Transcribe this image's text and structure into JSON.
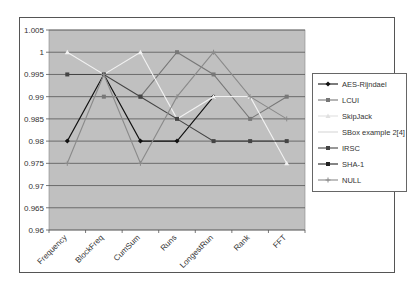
{
  "chart_data": {
    "type": "line",
    "title": "",
    "xlabel": "",
    "ylabel": "",
    "ylim": [
      0.96,
      1.005
    ],
    "yticks": [
      "1.005",
      "1",
      "0.995",
      "0.99",
      "0.985",
      "0.98",
      "0.975",
      "0.97",
      "0.965",
      "0.96"
    ],
    "grid": true,
    "legend_position": "right",
    "categories": [
      "Frequency",
      "BlockFreq",
      "CumSum",
      "Runs",
      "LongestRun",
      "Rank",
      "FFT"
    ],
    "series": [
      {
        "name": "AES-Rijndael",
        "color": "#111111",
        "marker": "diamond",
        "values": [
          0.98,
          0.995,
          0.98,
          0.98,
          0.99,
          null,
          null
        ]
      },
      {
        "name": "LCUI",
        "color": "#777777",
        "marker": "square",
        "values": [
          null,
          0.99,
          0.99,
          1.0,
          0.995,
          0.985,
          0.99
        ]
      },
      {
        "name": "SkipJack",
        "color": "#f2f2f2",
        "marker": "triangle",
        "values": [
          1.0,
          0.995,
          1.0,
          0.985,
          0.99,
          0.99,
          0.975
        ]
      },
      {
        "name": "SBox example 2[4]",
        "color": "#d8d8d8",
        "marker": "none",
        "values": [
          null,
          null,
          null,
          null,
          null,
          null,
          null
        ]
      },
      {
        "name": "IRSC",
        "color": "#444444",
        "marker": "square",
        "values": [
          0.995,
          0.995,
          0.99,
          0.985,
          0.98,
          0.98,
          0.98
        ]
      },
      {
        "name": "SHA-1",
        "color": "#222222",
        "marker": "square",
        "values": [
          null,
          null,
          null,
          null,
          null,
          null,
          null
        ]
      },
      {
        "name": "NULL",
        "color": "#8a8a8a",
        "marker": "plus",
        "values": [
          0.975,
          0.995,
          0.975,
          0.99,
          1.0,
          0.99,
          0.985
        ]
      }
    ]
  },
  "legend": {
    "items": [
      {
        "label": "AES-Rijndael"
      },
      {
        "label": "LCUI"
      },
      {
        "label": "SkipJack"
      },
      {
        "label": "SBox example 2[4]"
      },
      {
        "label": "IRSC"
      },
      {
        "label": "SHA-1"
      },
      {
        "label": "NULL"
      }
    ]
  }
}
